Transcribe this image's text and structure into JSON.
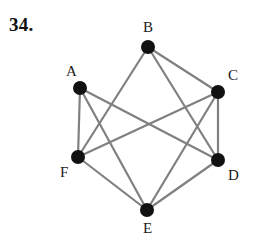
{
  "problem": {
    "number": "34."
  },
  "figure": {
    "type": "undirected-graph",
    "style": {
      "edge_color": "#808080",
      "edge_width": 2.2,
      "vertex_color": "#111111",
      "vertex_radius": 7,
      "background": "#ffffff"
    },
    "vertices": [
      {
        "id": "A",
        "label": "A",
        "x": 80,
        "y": 88,
        "label_x": 66,
        "label_y": 76
      },
      {
        "id": "B",
        "label": "B",
        "x": 148,
        "y": 47,
        "label_x": 143,
        "label_y": 32
      },
      {
        "id": "C",
        "label": "C",
        "x": 218,
        "y": 92,
        "label_x": 228,
        "label_y": 80
      },
      {
        "id": "D",
        "label": "D",
        "x": 218,
        "y": 160,
        "label_x": 228,
        "label_y": 180
      },
      {
        "id": "E",
        "label": "E",
        "x": 147,
        "y": 210,
        "label_x": 143,
        "label_y": 233
      },
      {
        "id": "F",
        "label": "F",
        "x": 78,
        "y": 157,
        "label_x": 60,
        "label_y": 177
      }
    ],
    "edges": [
      {
        "from": "A",
        "to": "F"
      },
      {
        "from": "A",
        "to": "D"
      },
      {
        "from": "A",
        "to": "E"
      },
      {
        "from": "B",
        "to": "C"
      },
      {
        "from": "B",
        "to": "F"
      },
      {
        "from": "B",
        "to": "D"
      },
      {
        "from": "C",
        "to": "D"
      },
      {
        "from": "C",
        "to": "F"
      },
      {
        "from": "C",
        "to": "E"
      },
      {
        "from": "D",
        "to": "E"
      },
      {
        "from": "E",
        "to": "F"
      }
    ]
  }
}
